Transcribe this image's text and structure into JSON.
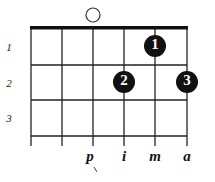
{
  "diagram": {
    "type": "chord-diagram",
    "strings": 6,
    "frets": 3,
    "open_strings": [
      3
    ],
    "fret_numbers": [
      "1",
      "2",
      "3"
    ],
    "dots": [
      {
        "string": 5,
        "fret": 1,
        "label": "1"
      },
      {
        "string": 4,
        "fret": 2,
        "label": "2"
      },
      {
        "string": 6,
        "fret": 2,
        "label": "3"
      }
    ],
    "finger_labels": [
      {
        "string": 3,
        "label": "p"
      },
      {
        "string": 4,
        "label": "i"
      },
      {
        "string": 5,
        "label": "m"
      },
      {
        "string": 6,
        "label": "a"
      }
    ]
  }
}
